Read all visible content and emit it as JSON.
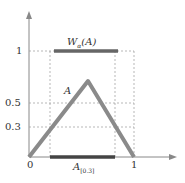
{
  "figure": {
    "y_ticks": [
      "1",
      "0.5",
      "0.3"
    ],
    "x_ticks": [
      "0",
      "1"
    ],
    "curve_label": "A",
    "top_bar_label_main": "W",
    "top_bar_label_sub": "α",
    "top_bar_label_tail": "(A)",
    "bottom_bar_label_main": "A",
    "bottom_bar_label_sub": "[0.3]"
  },
  "colors": {
    "curve": "#8a8a8a",
    "bar": "#555555",
    "axis": "#888888",
    "dash": "#999999"
  }
}
